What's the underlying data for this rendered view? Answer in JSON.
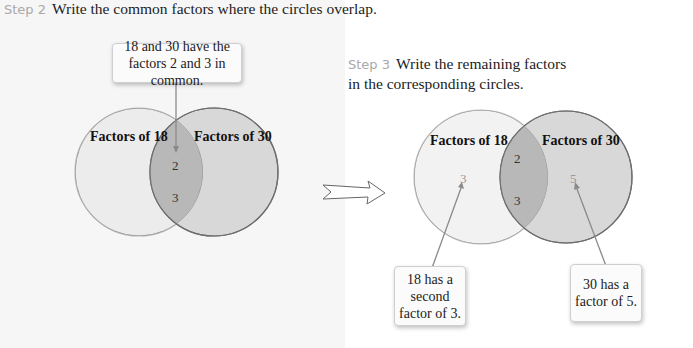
{
  "step2": {
    "label": "Step 2",
    "text": "Write the common factors where the circles overlap.",
    "callout": "18 and 30 have the factors 2 and 3 in common.",
    "circle_left_label": "Factors of 18",
    "circle_right_label": "Factors of 30",
    "overlap_values": [
      "2",
      "3"
    ]
  },
  "step3": {
    "label": "Step 3",
    "text_line1": "Write the remaining factors",
    "text_line2": "in the corresponding circles.",
    "circle_left_label": "Factors of 18",
    "circle_right_label": "Factors of 30",
    "overlap_values": [
      "2",
      "3"
    ],
    "left_only_value": "3",
    "right_only_value": "5",
    "callout_left": "18 has a second factor of 3.",
    "callout_right": "30 has a factor of 5."
  },
  "colors": {
    "left_circle_fill": "#ececec",
    "right_circle_fill": "#d9d9d9",
    "overlap_fill": "#b9b9b9",
    "step_label": "#a9a9a9"
  }
}
